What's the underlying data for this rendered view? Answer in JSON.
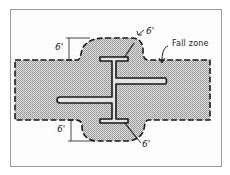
{
  "diagram": {
    "labels": {
      "fall_zone": "Fall zone",
      "dim_top_left": "6'",
      "dim_top_right": "6'",
      "dim_bottom_left": "6'",
      "dim_bottom_right": "6'"
    },
    "colors": {
      "zone_fill": "#c8c8c8",
      "outline": "#1a1a1a",
      "frame": "#9a9a9a"
    }
  }
}
